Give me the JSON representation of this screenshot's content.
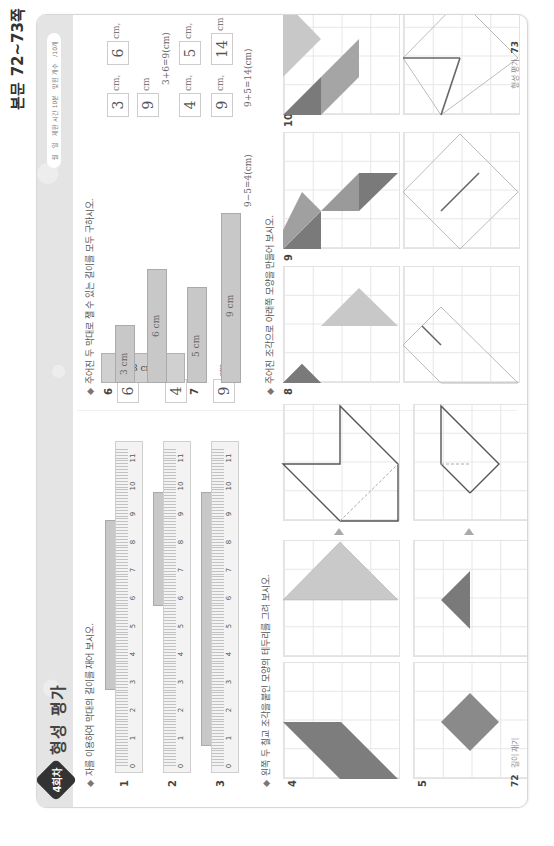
{
  "page_label": "본문 72~73쪽",
  "header": {
    "badge": "4회차",
    "title": "형성 평가",
    "status_pill": [
      "월",
      "일",
      "제한 시간 10분",
      "맞힌 개수",
      "/10개"
    ]
  },
  "section1": {
    "instruction": "자를 이용하여 막대의 길이를 재어 보시오.",
    "ruler_labels": [
      "0",
      "1",
      "2",
      "3",
      "4",
      "5",
      "6",
      "7",
      "8",
      "9",
      "10",
      "11"
    ],
    "problems": [
      {
        "num": "1",
        "bar_start": 3,
        "bar_end": 9,
        "answer": "6",
        "unit": "cm"
      },
      {
        "num": "2",
        "bar_start": 6,
        "bar_end": 10,
        "answer": "4",
        "unit": "cm"
      },
      {
        "num": "3",
        "bar_start": 1,
        "bar_end": 10,
        "answer": "9",
        "unit": "cm"
      }
    ]
  },
  "section2": {
    "instruction": "왼쪽 두 칠교 조각을 붙인 모양의 테두리를 그려 보시오.",
    "problems": [
      {
        "num": "4"
      },
      {
        "num": "5"
      }
    ]
  },
  "section3": {
    "instruction": "주어진 두 막대로 잴 수 있는 길이를 모두 구하시오.",
    "problems": [
      {
        "num": "6",
        "bars": [
          "3 cm",
          "6 cm"
        ],
        "answers": [
          "3",
          "6",
          "9"
        ],
        "units": [
          "cm,",
          "cm,",
          "cm"
        ],
        "work": "3+6=9(cm)"
      },
      {
        "num": "7",
        "bars": [
          "5 cm",
          "9 cm"
        ],
        "answers": [
          "4",
          "5",
          "9",
          "14"
        ],
        "units": [
          "cm,",
          "cm,",
          "cm,",
          "cm"
        ],
        "work": [
          "9−5=4(cm)",
          "9+5=14(cm)"
        ]
      }
    ]
  },
  "section4": {
    "instruction": "주어진 조각으로 아래쪽 모양을 만들어 보시오.",
    "problems": [
      {
        "num": "8"
      },
      {
        "num": "9"
      },
      {
        "num": "10"
      }
    ]
  },
  "footer": {
    "left_page": "72",
    "left_text": "길이 재기",
    "right_page": "73",
    "right_text": "형성 평가"
  }
}
